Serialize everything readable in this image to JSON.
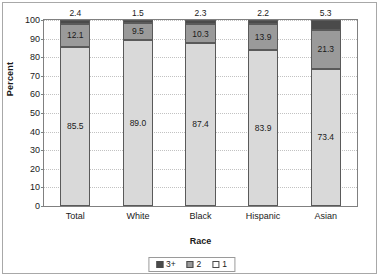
{
  "chart_data": {
    "type": "bar",
    "subtype": "stacked-bar-100",
    "title": "",
    "xlabel": "Race",
    "ylabel": "Percent",
    "ylim": [
      0,
      100
    ],
    "ytick_step": 10,
    "yticks": [
      0,
      10,
      20,
      30,
      40,
      50,
      60,
      70,
      80,
      90,
      100
    ],
    "ytick_labels": [
      "0",
      "10",
      "20",
      "30",
      "40",
      "50",
      "60",
      "70",
      "80",
      "90",
      "100"
    ],
    "grid": true,
    "grid_axis": "y",
    "grid_style": "dotted",
    "legend_position": "bottom-center",
    "categories": [
      "Total",
      "White",
      "Black",
      "Hispanic",
      "Asian"
    ],
    "series": [
      {
        "name": "1",
        "color": "#d9d9d9",
        "values": [
          85.5,
          89.0,
          87.4,
          83.9,
          73.4
        ],
        "labels": [
          "85.5",
          "89.0",
          "87.4",
          "83.9",
          "73.4"
        ],
        "labels_inside": true
      },
      {
        "name": "2",
        "color": "#9a9a9a",
        "values": [
          12.1,
          9.5,
          10.3,
          13.9,
          21.3
        ],
        "labels": [
          "12.1",
          "9.5",
          "10.3",
          "13.9",
          "21.3"
        ],
        "labels_inside": true
      },
      {
        "name": "3+",
        "color": "#4a4a4a",
        "values": [
          2.4,
          1.5,
          2.3,
          2.2,
          5.3
        ],
        "labels": [
          "2.4",
          "1.5",
          "2.3",
          "2.2",
          "5.3"
        ],
        "labels_inside": false
      }
    ],
    "legend_entries": [
      {
        "label": "3+",
        "color": "#4a4a4a"
      },
      {
        "label": "2",
        "color": "#9a9a9a"
      },
      {
        "label": "1",
        "color": "#ffffff"
      }
    ]
  }
}
